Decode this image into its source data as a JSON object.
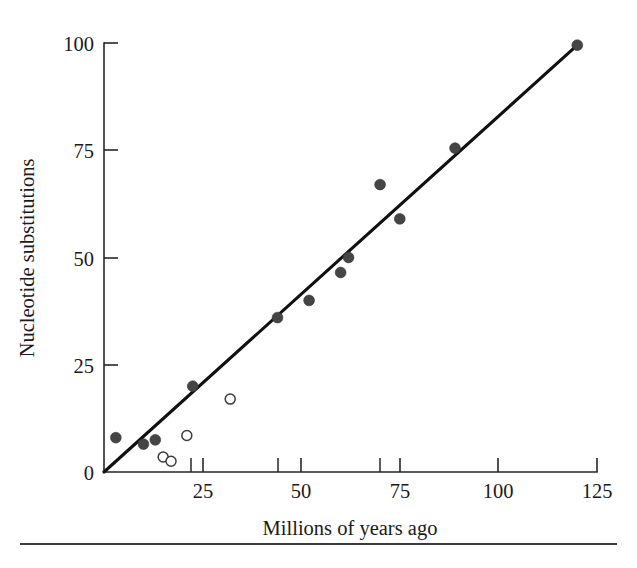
{
  "figure": {
    "background_color": "#ffffff",
    "ink_color": "#1a1a1a",
    "trend_line_color": "#111111",
    "filled_marker_color": "#454545",
    "open_marker_color": "#ffffff",
    "open_marker_stroke": "#3a3a3a",
    "footer_rule_color": "#3a3a3a"
  },
  "chart_data": {
    "type": "scatter",
    "title": "",
    "xlabel": "Millions of years ago",
    "ylabel": "Nucleotide substitutions",
    "xlim": [
      0,
      125
    ],
    "ylim": [
      0,
      100
    ],
    "grid": false,
    "legend": "none",
    "x_ticks_major": [
      0,
      25,
      50,
      75,
      100,
      125
    ],
    "x_tick_labels": [
      "",
      "25",
      "50",
      "75",
      "100",
      "125"
    ],
    "x_ticks_minor": [
      22,
      44,
      70
    ],
    "y_ticks": [
      0,
      25,
      50,
      75,
      100
    ],
    "y_tick_labels": [
      "0",
      "25",
      "50",
      "75",
      "100"
    ],
    "series": [
      {
        "name": "filled",
        "marker": "filled-circle",
        "points": [
          {
            "x": 3,
            "y": 8
          },
          {
            "x": 10,
            "y": 6.5
          },
          {
            "x": 13,
            "y": 7.5
          },
          {
            "x": 22.5,
            "y": 20
          },
          {
            "x": 44,
            "y": 36
          },
          {
            "x": 52,
            "y": 40
          },
          {
            "x": 60,
            "y": 46.5
          },
          {
            "x": 62,
            "y": 50
          },
          {
            "x": 70,
            "y": 67
          },
          {
            "x": 75,
            "y": 59
          },
          {
            "x": 89,
            "y": 75.5
          },
          {
            "x": 120,
            "y": 99.5
          }
        ]
      },
      {
        "name": "open",
        "marker": "open-circle",
        "points": [
          {
            "x": 15,
            "y": 3.5
          },
          {
            "x": 17,
            "y": 2.5
          },
          {
            "x": 21,
            "y": 8.5
          },
          {
            "x": 32,
            "y": 17
          }
        ]
      }
    ],
    "trend_line": {
      "name": "molecular-clock-fit",
      "x0": 0,
      "y0": 0,
      "x1": 120,
      "y1": 99.5
    }
  },
  "axis_titles": {
    "x": "Millions of years ago",
    "y": "Nucleotide substitutions"
  }
}
